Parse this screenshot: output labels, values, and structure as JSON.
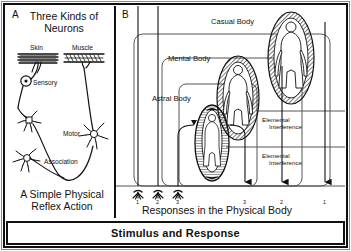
{
  "figure": {
    "caption": "Stimulus and Response"
  },
  "panel_a": {
    "letter": "A",
    "title_line1": "Three Kinds of",
    "title_line2": "Neurons",
    "caption_line1": "A Simple Physical",
    "caption_line2": "Reflex Action",
    "labels": {
      "skin": "Skin",
      "muscle": "Muscle",
      "sensory": "Sensory",
      "motor": "Motor",
      "association": "Association"
    }
  },
  "panel_b": {
    "letter": "B",
    "bodies": [
      {
        "name": "Casual Body"
      },
      {
        "name": "Mental Body"
      },
      {
        "name": "Astral Body"
      }
    ],
    "interference": [
      {
        "line1": "Elemental",
        "line2": "Interference"
      },
      {
        "line1": "Elemental",
        "line2": "Interference"
      }
    ],
    "axis_label": "Responses in the Physical Body",
    "stimulus_numbers": [
      "1",
      "2",
      "3"
    ],
    "response_numbers": [
      "3",
      "2",
      "1"
    ]
  },
  "colors": {
    "ink": "#111111",
    "hairline": "#8a8a8a",
    "thin_rule": "#555555",
    "paper": "#ffffff"
  }
}
